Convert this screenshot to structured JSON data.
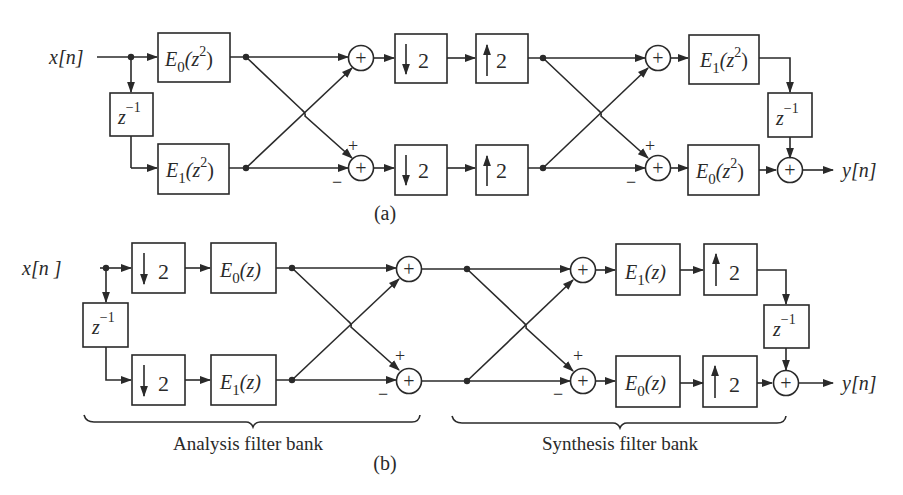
{
  "figure": {
    "part_a": {
      "label": "(a)",
      "input": "x[n]",
      "output": "y[n]",
      "blocks": {
        "e0_analysis": {
          "name": "E",
          "sub": "0",
          "arg": "(z",
          "pow": "2",
          "close": ")"
        },
        "e1_analysis": {
          "name": "E",
          "sub": "1",
          "arg": "(z",
          "pow": "2",
          "close": ")"
        },
        "delay_in": {
          "base": "z",
          "pow": "−1"
        },
        "down_top": {
          "value": "2"
        },
        "down_bottom": {
          "value": "2"
        },
        "up_top": {
          "value": "2"
        },
        "up_bottom": {
          "value": "2"
        },
        "e1_synthesis": {
          "name": "E",
          "sub": "1",
          "arg": "(z",
          "pow": "2",
          "close": ")"
        },
        "e0_synthesis": {
          "name": "E",
          "sub": "0",
          "arg": "(z",
          "pow": "2",
          "close": ")"
        },
        "delay_out": {
          "base": "z",
          "pow": "−1"
        }
      },
      "signs": {
        "plus": "+",
        "minus": "−",
        "sum": "+"
      }
    },
    "part_b": {
      "label": "(b)",
      "input": "x[n ]",
      "output": "y[n]",
      "blocks": {
        "down_top": {
          "value": "2"
        },
        "down_bottom": {
          "value": "2"
        },
        "e0_analysis": {
          "name": "E",
          "sub": "0",
          "arg": "(z)"
        },
        "e1_analysis": {
          "name": "E",
          "sub": "1",
          "arg": "(z)"
        },
        "delay_in": {
          "base": "z",
          "pow": "−1"
        },
        "e1_synthesis": {
          "name": "E",
          "sub": "1",
          "arg": "(z)"
        },
        "e0_synthesis": {
          "name": "E",
          "sub": "0",
          "arg": "(z)"
        },
        "up_top": {
          "value": "2"
        },
        "up_bottom": {
          "value": "2"
        },
        "delay_out": {
          "base": "z",
          "pow": "−1"
        }
      },
      "signs": {
        "plus": "+",
        "minus": "−",
        "sum": "+"
      },
      "brackets": {
        "analysis": "Analysis filter bank",
        "synthesis": "Synthesis filter bank"
      }
    },
    "colors": {
      "stroke": "#2a2a2a",
      "background": "#ffffff"
    }
  }
}
